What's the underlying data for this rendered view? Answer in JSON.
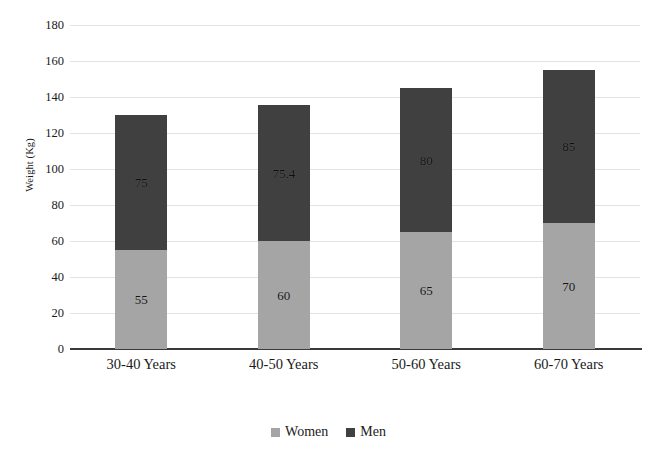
{
  "chart_data": {
    "type": "bar",
    "stacked": true,
    "title": "",
    "xlabel": "",
    "ylabel": "Weight (Kg)",
    "ylim": [
      0,
      180
    ],
    "ytick_step": 20,
    "yticks": [
      180,
      160,
      140,
      120,
      100,
      80,
      60,
      40,
      20,
      0
    ],
    "grid": true,
    "legend_position": "bottom",
    "categories": [
      "30-40 Years",
      "40-50 Years",
      "50-60 Years",
      "60-70 Years"
    ],
    "series": [
      {
        "name": "Women",
        "color": "#a5a5a5",
        "values": [
          55,
          60,
          65,
          70
        ],
        "labels": [
          "55",
          "60",
          "65",
          "70"
        ]
      },
      {
        "name": "Men",
        "color": "#404040",
        "values": [
          75,
          75.4,
          80,
          85
        ],
        "labels": [
          "75",
          "75.4",
          "80",
          "85"
        ]
      }
    ],
    "totals": [
      130,
      135.4,
      145,
      155
    ]
  },
  "axis": {
    "y_title": "Weight (Kg)",
    "ticks": [
      "180",
      "160",
      "140",
      "120",
      "100",
      "80",
      "60",
      "40",
      "20",
      "0"
    ]
  },
  "legend": {
    "items": [
      {
        "label": "Women",
        "color": "#a5a5a5"
      },
      {
        "label": "Men",
        "color": "#404040"
      }
    ]
  },
  "categories": [
    "30-40 Years",
    "40-50 Years",
    "50-60 Years",
    "60-70 Years"
  ]
}
